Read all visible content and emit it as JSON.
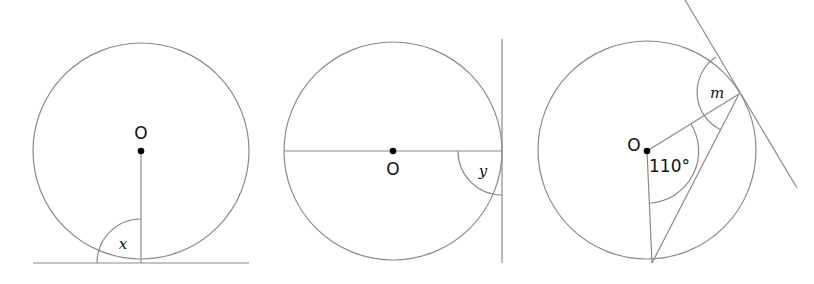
{
  "figures": [
    {
      "id": "tangent-bottom",
      "center_label": "O",
      "angle_label": "x",
      "description": "Radius drawn to point of tangency with horizontal tangent line; angle x between radius and tangent"
    },
    {
      "id": "tangent-right",
      "center_label": "O",
      "angle_label": "y",
      "description": "Diameter drawn to point of tangency with vertical tangent line; angle y between diameter and tangent"
    },
    {
      "id": "tangent-chord",
      "center_label": "O",
      "central_angle_label": "110°",
      "angle_label": "m",
      "description": "Central angle of 110° with chord and tangent line; angle m between radius and tangent"
    }
  ],
  "colors": {
    "stroke": "#8a8a8a",
    "text": "#111111",
    "dot": "#000000"
  }
}
